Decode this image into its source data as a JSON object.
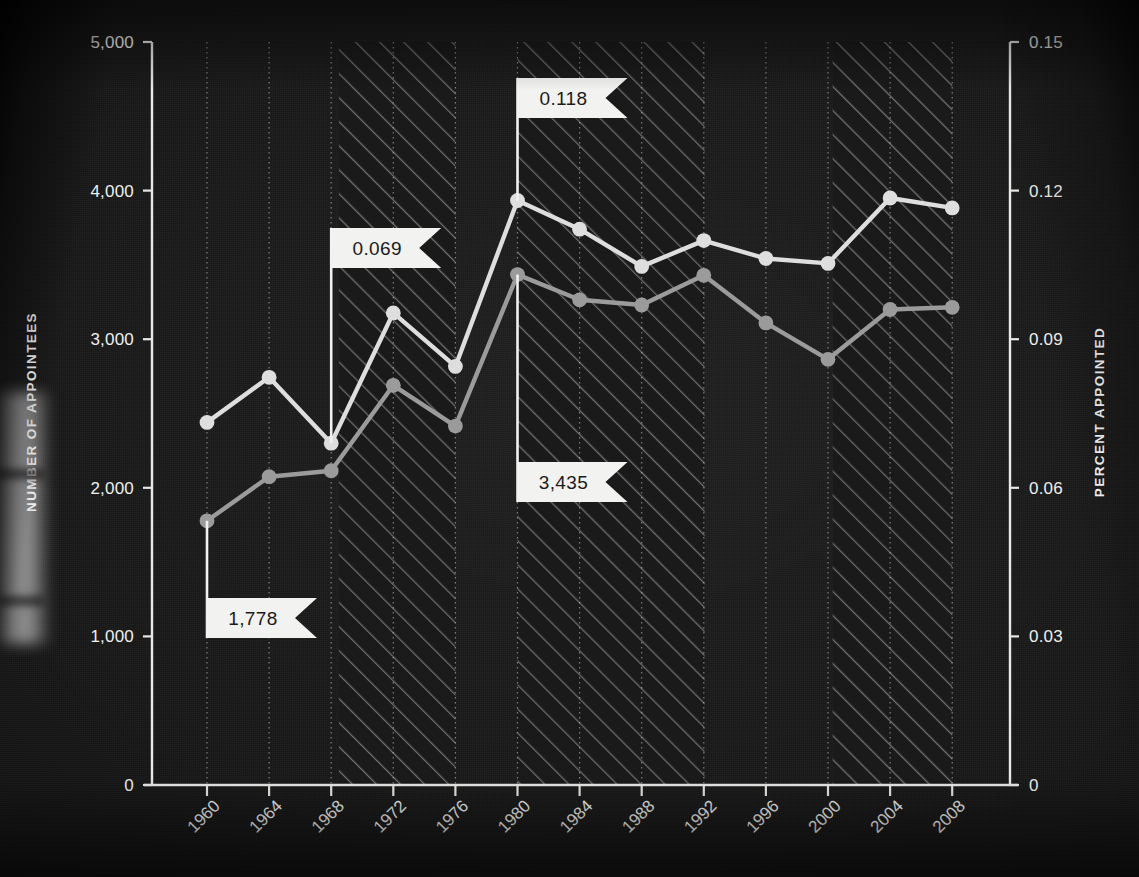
{
  "chart_data": {
    "type": "line",
    "title": "",
    "subtitle": "",
    "xlabel": "",
    "ylabel": "NUMBER OF APPOINTEES",
    "y2label": "PERCENT APPOINTED",
    "grid": "vertical dotted gridlines at each year tick",
    "legend": "none",
    "x": [
      1960,
      1964,
      1968,
      1972,
      1976,
      1980,
      1984,
      1988,
      1992,
      1996,
      2000,
      2004,
      2008
    ],
    "xticklabels": [
      "1960",
      "1964",
      "1968",
      "1972",
      "1976",
      "1980",
      "1984",
      "1988",
      "1992",
      "1996",
      "2000",
      "2004",
      "2008"
    ],
    "xlim": [
      1958,
      2009.8
    ],
    "ylim": [
      0,
      5000
    ],
    "yticks": [
      0,
      1000,
      2000,
      3000,
      4000,
      5000
    ],
    "yticklabels": [
      "0",
      "1,000",
      "2,000",
      "3,000",
      "4,000",
      "5,000"
    ],
    "y2lim": [
      0,
      0.15
    ],
    "y2ticks": [
      0,
      0.03,
      0.06,
      0.09,
      0.12,
      0.15
    ],
    "y2ticklabels": [
      "0",
      "0.03",
      "0.06",
      "0.09",
      "0.12",
      "0.15"
    ],
    "series": [
      {
        "name": "Percent appointed",
        "axis": "right",
        "color": "#dedede",
        "values": [
          0.0732,
          0.0823,
          0.069,
          0.0953,
          0.0845,
          0.118,
          0.1122,
          0.1047,
          0.1099,
          0.1063,
          0.1053,
          0.1185,
          0.1165
        ]
      },
      {
        "name": "Number of appointees",
        "axis": "left",
        "color": "#9b9b9b",
        "values": [
          1778,
          2075,
          2115,
          2690,
          2415,
          3435,
          3265,
          3230,
          3430,
          3110,
          2865,
          3200,
          3215
        ]
      }
    ],
    "shaded_bands": [
      {
        "label": "band-1",
        "start": 1968.5,
        "end": 1976.0
      },
      {
        "label": "band-2",
        "start": 1980.0,
        "end": 1992.05
      },
      {
        "label": "band-3",
        "start": 2000.3,
        "end": 2008.0
      }
    ],
    "annotations": [
      {
        "name": "callout-percent-1968",
        "text": "0.069",
        "x": 1968,
        "series": "Percent appointed"
      },
      {
        "name": "callout-percent-1980",
        "text": "0.118",
        "x": 1980,
        "series": "Percent appointed"
      },
      {
        "name": "callout-appointees-1980",
        "text": "3,435",
        "x": 1980,
        "series": "Number of appointees"
      },
      {
        "name": "callout-appointees-1960",
        "text": "1,778",
        "x": 1960,
        "series": "Number of appointees"
      }
    ],
    "colors": {
      "background": "#151515",
      "axis": "#e8e8e6",
      "gridline": "#cfcfcf",
      "series_percent": "#dedede",
      "series_count": "#9b9b9b",
      "callout_fill": "#f2f2f0",
      "callout_text": "#1b1b1b"
    }
  }
}
